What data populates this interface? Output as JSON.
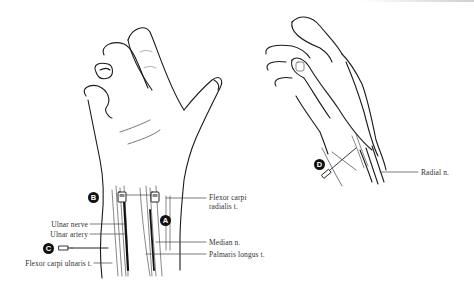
{
  "figure": {
    "left_view": {
      "markers": [
        {
          "id": "B",
          "label": "B"
        },
        {
          "id": "A",
          "label": "A"
        },
        {
          "id": "C",
          "label": "C"
        }
      ],
      "labels_left": [
        {
          "text": "Ulnar nerve"
        },
        {
          "text": "Ulnar artery"
        },
        {
          "text": "Flexor carpi ulnaris t."
        }
      ],
      "labels_right": [
        {
          "text": "Flexor carpi"
        },
        {
          "text": "radialis t."
        },
        {
          "text": "Median n."
        },
        {
          "text": "Palmaris longus t."
        }
      ]
    },
    "right_view": {
      "markers": [
        {
          "id": "D",
          "label": "D"
        }
      ],
      "labels": [
        {
          "text": "Radial n."
        }
      ]
    },
    "colors": {
      "line": "#1a1a1a",
      "fine_line": "#666666",
      "marker_bg": "#111111",
      "marker_fg": "#ffffff",
      "text": "#333333"
    }
  }
}
